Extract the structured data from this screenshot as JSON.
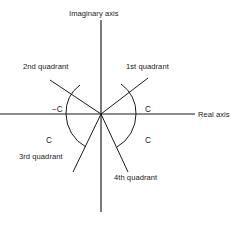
{
  "figure": {
    "type": "complex-plane-quadrant-diagram",
    "background_color": "#ffffff",
    "stroke_color": "#1a1a1a"
  },
  "axes": {
    "imaginary_label": "Imaginary axis",
    "real_label": "Real axis",
    "origin": {
      "x": 101,
      "y": 114
    },
    "vertical": {
      "x": 101,
      "y1": 20,
      "y2": 212
    },
    "horizontal": {
      "y": 114,
      "x1": 0,
      "x2": 195
    }
  },
  "quadrants": [
    {
      "id": "first",
      "label": "1st quadrant",
      "label_x": 126,
      "label_y": 69,
      "ray_end_x": 148,
      "ray_end_y": 78,
      "angle_label": "C",
      "angle_x": 128,
      "angle_y": 112
    },
    {
      "id": "second",
      "label": "2nd quadrant",
      "label_x": 23,
      "label_y": 69,
      "ray_end_x": 50,
      "ray_end_y": 80,
      "angle_label": "−C",
      "angle_x": 52,
      "angle_y": 112
    },
    {
      "id": "third",
      "label": "3rd quadrant",
      "label_x": 19,
      "label_y": 159,
      "ray_end_x": 73,
      "ray_end_y": 172,
      "angle_label": "C",
      "angle_x": 46,
      "angle_y": 143
    },
    {
      "id": "fourth",
      "label": "4th quadrant",
      "label_x": 114,
      "label_y": 180,
      "ray_end_x": 128,
      "ray_end_y": 172,
      "angle_label": "C",
      "angle_x": 145,
      "angle_y": 143
    }
  ],
  "arcs": [
    {
      "id": "arc-first",
      "d": "M 136 114 A 35 35 0 0 0 121 84"
    },
    {
      "id": "arc-second",
      "d": "M 66 114 A 35 35 0 0 1 80 85"
    },
    {
      "id": "arc-third",
      "d": "M 66 114 A 38 38 0 0 0 86 147"
    },
    {
      "id": "arc-fourth",
      "d": "M 136 114 A 38 38 0 0 1 117 147"
    }
  ],
  "labels": {
    "imaginary_x": 69,
    "imaginary_y": 16,
    "real_x": 198,
    "real_y": 117
  }
}
